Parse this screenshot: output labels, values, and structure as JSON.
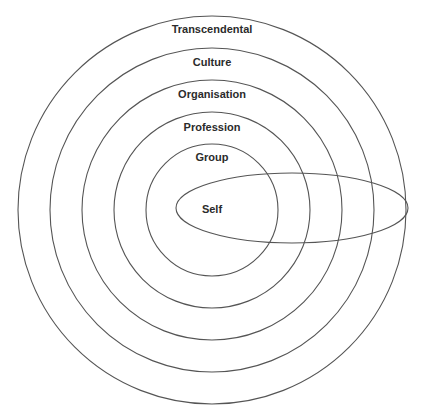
{
  "diagram": {
    "type": "concentric-circles",
    "center": {
      "x": 212,
      "y": 210
    },
    "rings": [
      {
        "label": "Transcendental",
        "r": 194,
        "label_y": 33
      },
      {
        "label": "Culture",
        "r": 162,
        "label_y": 66
      },
      {
        "label": "Organisation",
        "r": 130,
        "label_y": 98
      },
      {
        "label": "Profession",
        "r": 98,
        "label_y": 131
      },
      {
        "label": "Group",
        "r": 66,
        "label_y": 161
      }
    ],
    "self": {
      "label": "Self",
      "cx": 292,
      "cy": 208,
      "rx": 116,
      "ry": 35,
      "label_x": 212,
      "label_y": 213
    },
    "stroke_color": "#555555",
    "text_color": "#2b2b2b"
  }
}
